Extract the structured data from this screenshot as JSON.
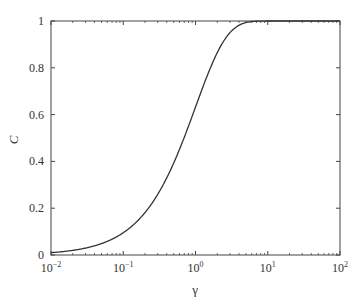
{
  "chart_data": {
    "type": "line",
    "title": "",
    "xlabel": "γ",
    "ylabel": "C",
    "xscale": "log",
    "xlim": [
      0.01,
      100
    ],
    "ylim": [
      0,
      1
    ],
    "grid": false,
    "legend": null,
    "x_ticks": [
      "10^-2",
      "10^-1",
      "10^0",
      "10^1",
      "10^2"
    ],
    "y_ticks": [
      "0",
      "0.2",
      "0.4",
      "0.6",
      "0.8",
      "1"
    ],
    "series": [
      {
        "name": "C",
        "color": "#333333",
        "x": [
          0.01,
          0.02,
          0.05,
          0.1,
          0.2,
          0.3,
          0.5,
          0.7,
          1,
          1.5,
          2,
          3,
          4,
          5,
          6,
          8,
          10,
          20,
          50,
          100
        ],
        "y": [
          0.01,
          0.02,
          0.049,
          0.095,
          0.181,
          0.259,
          0.393,
          0.503,
          0.632,
          0.777,
          0.865,
          0.95,
          0.982,
          0.993,
          0.998,
          1.0,
          1.0,
          1.0,
          1.0,
          1.0
        ]
      }
    ]
  }
}
